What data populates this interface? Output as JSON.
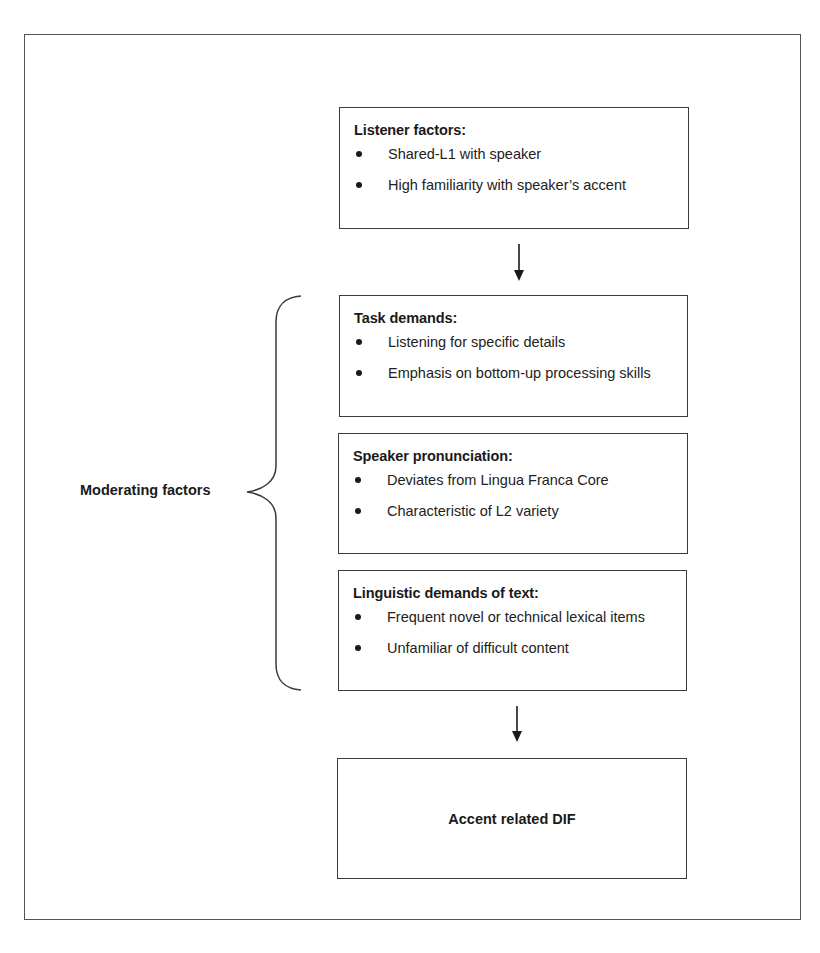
{
  "diagram": {
    "listener_box": {
      "title": "Listener factors:",
      "items": [
        "Shared-L1 with speaker",
        "High familiarity with speaker’s accent"
      ]
    },
    "moderating_group": {
      "label": "Moderating factors",
      "boxes": [
        {
          "title": "Task demands:",
          "items": [
            "Listening for specific details",
            "Emphasis on bottom-up processing skills"
          ]
        },
        {
          "title": "Speaker pronunciation:",
          "items": [
            "Deviates from Lingua Franca Core",
            "Characteristic of L2 variety"
          ]
        },
        {
          "title": "Linguistic demands of text:",
          "items": [
            "Frequent novel or technical lexical items",
            "Unfamiliar of difficult content"
          ]
        }
      ]
    },
    "outcome_box": {
      "label": "Accent related DIF"
    },
    "connectors": [
      {
        "from": "listener_box",
        "to": "moderating_group",
        "type": "arrow-down"
      },
      {
        "from": "moderating_group",
        "to": "outcome_box",
        "type": "arrow-down"
      }
    ],
    "colors": {
      "line": "#3a3a3a",
      "text": "#1a1a1a",
      "background": "#ffffff"
    }
  }
}
